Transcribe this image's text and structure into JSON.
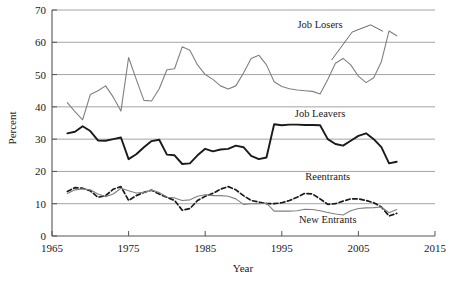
{
  "chart_data": {
    "type": "line",
    "title": "",
    "xlabel": "Year",
    "ylabel": "Percent",
    "xlim": [
      1965,
      2015
    ],
    "ylim": [
      0,
      70
    ],
    "xticks": [
      1965,
      1975,
      1985,
      1995,
      2005,
      2015
    ],
    "yticks": [
      0,
      10,
      20,
      30,
      40,
      50,
      60,
      70
    ],
    "grid": "horizontal",
    "legend_position": "inline-annotations",
    "colors": {
      "job_losers": "#808080",
      "job_leavers": "#1a1a1a",
      "reentrants": "#1a1a1a",
      "new_entrants": "#808080",
      "grid": "#9a9a9a",
      "axis": "#555555"
    },
    "annotations": [
      {
        "text": "Job Losers",
        "x": 2000,
        "y": 64.5
      },
      {
        "text": "Job Leavers",
        "x": 2000,
        "y": 37.0
      },
      {
        "text": "Reentrants",
        "x": 2001,
        "y": 17.5
      },
      {
        "text": "New Entrants",
        "x": 2001,
        "y": 4.0
      }
    ],
    "series": [
      {
        "name": "Job Losers",
        "style": "solid",
        "color": "#808080",
        "width": 1.1,
        "x": [
          1967,
          1968,
          1969,
          1970,
          1971,
          1972,
          1973,
          1974,
          1975,
          1976,
          1977,
          1978,
          1979,
          1980,
          1981,
          1982,
          1983,
          1984,
          1985,
          1986,
          1987,
          1988,
          1989,
          1990,
          1991,
          1992,
          1993,
          1994,
          1995,
          1996,
          1997,
          1998,
          1999,
          2000,
          2001,
          2002,
          2003,
          2004,
          2005,
          2006,
          2007,
          2008,
          2009,
          2010
        ],
        "values": [
          41.3,
          38.5,
          36.0,
          43.8,
          45.0,
          46.5,
          43.0,
          38.7,
          55.3,
          48.5,
          42.0,
          41.8,
          45.6,
          51.5,
          51.8,
          58.6,
          57.5,
          53.0,
          50.0,
          48.5,
          46.5,
          45.5,
          46.5,
          50.5,
          55.0,
          56.0,
          53.0,
          47.8,
          46.3,
          45.6,
          45.2,
          45.0,
          44.8,
          44.0,
          48.5,
          53.5,
          55.0,
          53.0,
          49.5,
          47.5,
          49.0,
          54.0,
          63.5,
          62.0
        ]
      },
      {
        "name": "Job Leavers",
        "style": "solid",
        "color": "#1a1a1a",
        "width": 1.9,
        "x": [
          1967,
          1968,
          1969,
          1970,
          1971,
          1972,
          1973,
          1974,
          1975,
          1976,
          1977,
          1978,
          1979,
          1980,
          1981,
          1982,
          1983,
          1984,
          1985,
          1986,
          1987,
          1988,
          1989,
          1990,
          1991,
          1992,
          1993,
          1994,
          1995,
          1996,
          1997,
          1998,
          1999,
          2000,
          2001,
          2002,
          2003,
          2004,
          2005,
          2006,
          2007,
          2008,
          2009,
          2010
        ],
        "values": [
          31.8,
          32.3,
          34.0,
          32.5,
          29.6,
          29.5,
          30.0,
          30.5,
          23.8,
          25.3,
          27.5,
          29.4,
          29.8,
          25.2,
          25.0,
          22.3,
          22.5,
          25.0,
          27.0,
          26.2,
          26.8,
          27.0,
          28.0,
          27.5,
          24.8,
          23.8,
          24.3,
          34.6,
          34.3,
          34.5,
          34.5,
          34.4,
          34.4,
          34.3,
          30.0,
          28.5,
          28.0,
          29.5,
          31.0,
          31.8,
          30.0,
          27.5,
          22.5,
          23.0
        ]
      },
      {
        "name": "Reentrants",
        "style": "dashed",
        "color": "#1a1a1a",
        "width": 1.7,
        "x": [
          1967,
          1968,
          1969,
          1970,
          1971,
          1972,
          1973,
          1974,
          1975,
          1976,
          1977,
          1978,
          1979,
          1980,
          1981,
          1982,
          1983,
          1984,
          1985,
          1986,
          1987,
          1988,
          1989,
          1990,
          1991,
          1992,
          1993,
          1994,
          1995,
          1996,
          1997,
          1998,
          1999,
          2000,
          2001,
          2002,
          2003,
          2004,
          2005,
          2006,
          2007,
          2008,
          2009,
          2010
        ],
        "values": [
          13.8,
          15.0,
          14.8,
          14.0,
          12.0,
          12.5,
          14.5,
          15.3,
          11.0,
          12.5,
          13.5,
          14.2,
          13.0,
          12.0,
          11.0,
          8.0,
          8.5,
          11.0,
          12.3,
          13.2,
          14.5,
          15.3,
          14.3,
          12.5,
          11.0,
          10.5,
          10.0,
          10.0,
          10.3,
          11.0,
          12.0,
          13.2,
          13.0,
          11.5,
          9.8,
          10.0,
          10.8,
          11.5,
          11.5,
          11.0,
          10.3,
          9.0,
          6.2,
          7.0
        ]
      },
      {
        "name": "New Entrants",
        "style": "solid",
        "color": "#808080",
        "width": 1.1,
        "x": [
          1967,
          1968,
          1969,
          1970,
          1971,
          1972,
          1973,
          1974,
          1975,
          1976,
          1977,
          1978,
          1979,
          1980,
          1981,
          1982,
          1983,
          1984,
          1985,
          1986,
          1987,
          1988,
          1989,
          1990,
          1991,
          1992,
          1993,
          1994,
          1995,
          1996,
          1997,
          1998,
          1999,
          2000,
          2001,
          2002,
          2003,
          2004,
          2005,
          2006,
          2007,
          2008,
          2009,
          2010
        ],
        "values": [
          13.2,
          14.3,
          14.6,
          14.3,
          13.0,
          12.2,
          13.0,
          14.8,
          14.0,
          13.3,
          13.5,
          14.2,
          13.5,
          12.0,
          11.8,
          11.0,
          11.2,
          12.3,
          12.8,
          12.5,
          12.5,
          12.3,
          11.5,
          9.8,
          10.0,
          10.0,
          10.2,
          7.7,
          7.7,
          7.7,
          7.8,
          8.3,
          8.2,
          7.8,
          7.3,
          6.8,
          6.5,
          7.8,
          8.5,
          8.7,
          8.8,
          9.0,
          7.2,
          8.2
        ]
      }
    ]
  }
}
